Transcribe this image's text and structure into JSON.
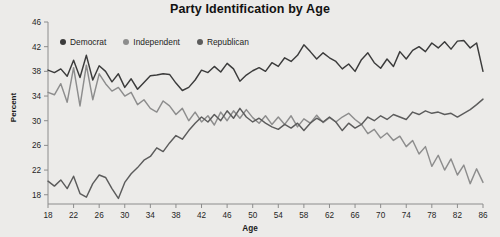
{
  "chart_data": {
    "type": "line",
    "title": "Party Identification by Age",
    "xlabel": "Age",
    "ylabel": "Percent",
    "xlim": [
      18,
      86
    ],
    "ylim": [
      16.5,
      46
    ],
    "grid": false,
    "legend_position": "top-left-inside",
    "xticks": [
      18,
      22,
      26,
      30,
      34,
      38,
      42,
      46,
      50,
      54,
      58,
      62,
      66,
      70,
      74,
      78,
      82,
      86
    ],
    "yticks": [
      18,
      22,
      26,
      30,
      34,
      38,
      42,
      46
    ],
    "x": [
      18,
      19,
      20,
      21,
      22,
      23,
      24,
      25,
      26,
      27,
      28,
      29,
      30,
      31,
      32,
      33,
      34,
      35,
      36,
      37,
      38,
      39,
      40,
      41,
      42,
      43,
      44,
      45,
      46,
      47,
      48,
      49,
      50,
      51,
      52,
      53,
      54,
      55,
      56,
      57,
      58,
      59,
      60,
      61,
      62,
      63,
      64,
      65,
      66,
      67,
      68,
      69,
      70,
      71,
      72,
      73,
      74,
      75,
      76,
      77,
      78,
      79,
      80,
      81,
      82,
      83,
      84,
      85,
      86
    ],
    "series": [
      {
        "name": "Democrat",
        "color": "#3b3b3b",
        "values": [
          38.2,
          37.8,
          38.4,
          37.2,
          39.8,
          37.0,
          40.6,
          36.6,
          38.9,
          38.0,
          36.3,
          37.6,
          35.4,
          36.8,
          35.1,
          36.2,
          37.3,
          37.4,
          37.6,
          37.5,
          36.1,
          34.9,
          35.4,
          36.6,
          38.2,
          37.8,
          38.8,
          37.9,
          39.3,
          38.4,
          36.4,
          37.4,
          38.1,
          38.6,
          38.0,
          39.4,
          38.8,
          40.2,
          39.6,
          40.6,
          42.3,
          41.2,
          40.0,
          41.0,
          40.2,
          39.6,
          38.4,
          39.2,
          38.0,
          39.9,
          41.0,
          39.4,
          38.5,
          40.0,
          38.8,
          41.2,
          40.0,
          41.4,
          42.0,
          41.2,
          42.6,
          41.8,
          42.8,
          41.6,
          42.9,
          43.0,
          41.8,
          42.6,
          38.0
        ]
      },
      {
        "name": "Independent",
        "color": "#8d8d8d",
        "values": [
          34.6,
          34.2,
          36.0,
          33.0,
          38.6,
          32.4,
          39.0,
          33.4,
          37.6,
          36.0,
          34.8,
          35.4,
          34.0,
          34.6,
          32.6,
          33.4,
          32.0,
          31.4,
          33.2,
          32.4,
          31.0,
          32.0,
          30.0,
          31.4,
          29.8,
          30.8,
          29.3,
          31.4,
          30.0,
          31.6,
          30.4,
          31.8,
          30.5,
          29.6,
          30.8,
          29.4,
          30.6,
          29.4,
          30.8,
          29.0,
          30.3,
          29.6,
          30.9,
          29.7,
          30.5,
          29.8,
          30.6,
          31.2,
          30.2,
          29.4,
          27.9,
          28.6,
          27.2,
          28.0,
          26.8,
          27.5,
          25.8,
          26.8,
          24.6,
          25.8,
          22.6,
          24.4,
          22.0,
          23.8,
          21.2,
          22.8,
          19.8,
          22.2,
          20.0
        ]
      },
      {
        "name": "Republican",
        "color": "#5c5c5c",
        "values": [
          20.2,
          19.4,
          20.4,
          19.0,
          21.0,
          18.2,
          17.6,
          19.8,
          21.2,
          20.8,
          19.0,
          17.4,
          20.0,
          21.4,
          22.4,
          23.6,
          24.2,
          25.6,
          25.0,
          26.4,
          27.6,
          27.0,
          28.4,
          29.6,
          30.6,
          29.8,
          31.0,
          30.0,
          31.6,
          30.4,
          32.0,
          30.6,
          29.8,
          30.4,
          29.6,
          29.0,
          28.6,
          29.4,
          28.8,
          29.6,
          28.4,
          29.6,
          30.4,
          29.8,
          30.6,
          29.8,
          28.4,
          29.6,
          28.8,
          29.4,
          30.6,
          30.0,
          30.8,
          30.2,
          31.0,
          30.6,
          30.2,
          31.4,
          31.0,
          31.6,
          31.2,
          31.4,
          31.0,
          31.2,
          30.6,
          31.2,
          31.8,
          32.6,
          33.5
        ]
      }
    ]
  }
}
